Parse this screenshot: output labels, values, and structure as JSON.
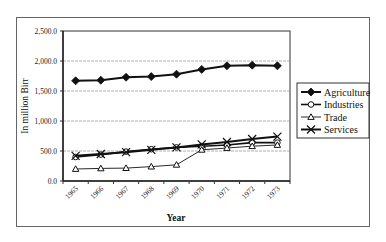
{
  "chart_data": {
    "type": "line",
    "title": "",
    "xlabel": "Year",
    "ylabel": "In million Birr",
    "ylim": [
      0,
      2500
    ],
    "yticks": [
      "0.0",
      "500.0",
      "1,000.0",
      "1,500.0",
      "2,000.0",
      "2,500.0"
    ],
    "grid": "horizontal",
    "legend_position": "right",
    "categories": [
      "1965",
      "1966",
      "1967",
      "1968",
      "1969",
      "1970",
      "1971",
      "1972",
      "1973"
    ],
    "series": [
      {
        "name": "Agriculture",
        "marker": "diamond-filled",
        "values": [
          1670,
          1680,
          1730,
          1740,
          1780,
          1860,
          1920,
          1930,
          1920
        ]
      },
      {
        "name": "Industries",
        "marker": "circle-open",
        "values": [
          400,
          440,
          490,
          530,
          560,
          580,
          600,
          640,
          640
        ]
      },
      {
        "name": "Trade",
        "marker": "triangle-open",
        "values": [
          200,
          210,
          215,
          240,
          270,
          520,
          550,
          580,
          600
        ]
      },
      {
        "name": "Services",
        "marker": "x",
        "values": [
          420,
          450,
          480,
          520,
          560,
          610,
          650,
          700,
          740
        ]
      }
    ]
  },
  "legend": {
    "items": [
      "Agriculture",
      "Industries",
      "Trade",
      "Services"
    ]
  },
  "axes": {
    "ylabel": "In million Birr",
    "xlabel": "Year"
  }
}
